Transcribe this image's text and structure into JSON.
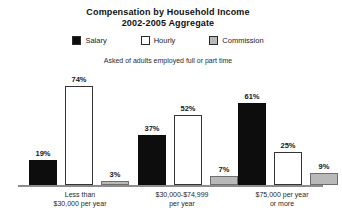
{
  "chart_data": {
    "type": "bar",
    "title": "Compensation by Household Income 2002-2005 Aggregate",
    "title_lines": [
      "Compensation by Household Income",
      "2002-2005 Aggregate"
    ],
    "subtitle": "Asked of adults employed full or part time",
    "xlabel": "",
    "ylabel": "",
    "ylim": [
      0,
      80
    ],
    "grid": false,
    "legend_position": "top-center",
    "categories": [
      "Less than $30,000 per year",
      "$30,000-$74,999 per year",
      "$75,000 per year or more"
    ],
    "category_label_lines": [
      [
        "Less than",
        "$30,000 per year"
      ],
      [
        "$30,000-$74,999",
        "per year"
      ],
      [
        "$75,000 per year",
        "or more"
      ]
    ],
    "series": [
      {
        "name": "Salary",
        "color": "#0d0d0d",
        "values": [
          19,
          37,
          61
        ],
        "value_labels": [
          "19%",
          "37%",
          "61%"
        ]
      },
      {
        "name": "Hourly",
        "color": "#ffffff",
        "values": [
          74,
          52,
          25
        ],
        "value_labels": [
          "74%",
          "52%",
          "25%"
        ]
      },
      {
        "name": "Commission",
        "color": "#b9b9b9",
        "values": [
          3,
          7,
          9
        ],
        "value_labels": [
          "3%",
          "7%",
          "9%"
        ]
      }
    ],
    "legend": [
      {
        "label": "Salary",
        "swatch": "black-filled-square",
        "color": "#0d0d0d"
      },
      {
        "label": "Hourly",
        "swatch": "white-outlined-square",
        "color": "#ffffff"
      },
      {
        "label": "Commission",
        "swatch": "gray-filled-square",
        "color": "#b9b9b9"
      }
    ],
    "colors": {
      "background": "#ffffff",
      "text": "#1a1a1a",
      "baseline": "#8c8c8c"
    }
  }
}
